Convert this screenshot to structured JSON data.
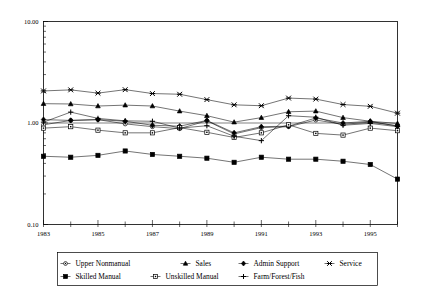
{
  "chart_data": {
    "type": "line",
    "title": "",
    "xlabel": "",
    "ylabel": "",
    "yscale": "log",
    "ylim": [
      0.1,
      10.0
    ],
    "xlim": [
      1983,
      1996
    ],
    "grid": false,
    "legend_position": "bottom",
    "y_ticks": [
      "10.00",
      "1.00",
      "0.10"
    ],
    "y_tick_values": [
      10.0,
      1.0,
      0.1
    ],
    "x_ticks": [
      "1983",
      "1985",
      "1987",
      "1989",
      "1991",
      "1993",
      "1995"
    ],
    "x_tick_values": [
      1983,
      1985,
      1987,
      1989,
      1991,
      1993,
      1995
    ],
    "x": [
      1983,
      1984,
      1985,
      1986,
      1987,
      1988,
      1989,
      1990,
      1991,
      1992,
      1993,
      1994,
      1995,
      1996
    ],
    "series": [
      {
        "name": "Upper Nonmanual",
        "marker": "circle-open",
        "values": [
          0.96,
          1.06,
          1.08,
          0.98,
          0.92,
          0.88,
          1.05,
          0.78,
          0.9,
          0.92,
          1.07,
          0.97,
          1.02,
          0.94
        ]
      },
      {
        "name": "Sales",
        "marker": "triangle-filled",
        "values": [
          1.55,
          1.54,
          1.47,
          1.5,
          1.47,
          1.31,
          1.18,
          1.02,
          1.13,
          1.29,
          1.31,
          1.13,
          1.04,
          0.99
        ]
      },
      {
        "name": "Admin Support",
        "marker": "diamond-filled",
        "values": [
          1.08,
          1.06,
          1.08,
          1.04,
          0.95,
          0.93,
          1.06,
          0.8,
          0.92,
          0.93,
          1.12,
          1.0,
          1.04,
          0.93
        ]
      },
      {
        "name": "Service",
        "marker": "star-x",
        "values": [
          2.07,
          2.12,
          1.97,
          2.13,
          1.95,
          1.92,
          1.7,
          1.51,
          1.48,
          1.76,
          1.72,
          1.52,
          1.46,
          1.25
        ]
      },
      {
        "name": "Skilled Manual",
        "marker": "square-filled",
        "values": [
          0.47,
          0.46,
          0.48,
          0.53,
          0.49,
          0.47,
          0.45,
          0.41,
          0.46,
          0.44,
          0.44,
          0.42,
          0.39,
          0.28
        ]
      },
      {
        "name": "Unskilled Manual",
        "marker": "square-open",
        "values": [
          0.89,
          0.92,
          0.85,
          0.8,
          0.8,
          0.9,
          0.81,
          0.72,
          0.8,
          0.96,
          0.79,
          0.76,
          0.89,
          0.84
        ]
      },
      {
        "name": "Farm/Forest/Fish",
        "marker": "plus",
        "values": [
          1.02,
          1.28,
          1.11,
          1.05,
          1.04,
          0.89,
          0.94,
          0.74,
          0.67,
          1.18,
          1.14,
          0.95,
          0.99,
          0.92
        ]
      }
    ]
  },
  "legend": {
    "entries": [
      {
        "label": "Upper Nonmanual",
        "marker": "circle-open"
      },
      {
        "label": "Sales",
        "marker": "triangle-filled"
      },
      {
        "label": "Admin Support",
        "marker": "diamond-filled"
      },
      {
        "label": "Service",
        "marker": "star-x"
      },
      {
        "label": "Skilled Manual",
        "marker": "square-filled"
      },
      {
        "label": "Unskilled Manual",
        "marker": "square-open"
      },
      {
        "label": "Farm/Forest/Fish",
        "marker": "plus"
      }
    ]
  },
  "colors": {
    "ink": "#000000",
    "background": "#ffffff"
  }
}
